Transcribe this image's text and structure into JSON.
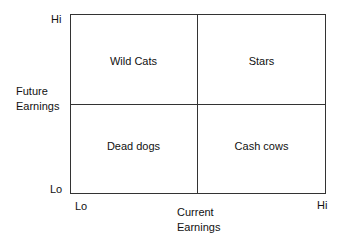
{
  "diagram": {
    "type": "2x2 matrix",
    "y_axis": {
      "label_line1": "Future",
      "label_line2": "Earnings",
      "hi": "Hi",
      "lo": "Lo"
    },
    "x_axis": {
      "label_line1": "Current",
      "label_line2": "Earnings",
      "lo": "Lo",
      "hi": "Hi"
    },
    "quadrants": {
      "top_left": "Wild Cats",
      "top_right": "Stars",
      "bottom_left": "Dead dogs",
      "bottom_right": "Cash cows"
    },
    "line_color": "#333333"
  }
}
